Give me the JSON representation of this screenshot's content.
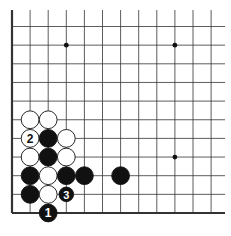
{
  "diagram": {
    "type": "go-board-corner",
    "corner": "bottom-left",
    "colors": {
      "background": "#ffffff",
      "line": "#333333",
      "black_stone": "#111111",
      "white_stone": "#ffffff"
    },
    "star_points": [
      {
        "col": 3,
        "row": 1
      },
      {
        "col": 9,
        "row": 1
      },
      {
        "col": 9,
        "row": 7
      }
    ],
    "stones": [
      {
        "color": "white",
        "col": 1,
        "row": 5
      },
      {
        "color": "white",
        "col": 2,
        "row": 5
      },
      {
        "color": "white",
        "col": 1,
        "row": 6,
        "label": "2"
      },
      {
        "color": "black",
        "col": 2,
        "row": 6
      },
      {
        "color": "white",
        "col": 3,
        "row": 6
      },
      {
        "color": "white",
        "col": 1,
        "row": 7
      },
      {
        "color": "black",
        "col": 2,
        "row": 7
      },
      {
        "color": "white",
        "col": 3,
        "row": 7
      },
      {
        "color": "black",
        "col": 1,
        "row": 8
      },
      {
        "color": "white",
        "col": 2,
        "row": 8
      },
      {
        "color": "black",
        "col": 3,
        "row": 8
      },
      {
        "color": "black",
        "col": 4,
        "row": 8
      },
      {
        "color": "black",
        "col": 6,
        "row": 8
      },
      {
        "color": "black",
        "col": 1,
        "row": 9
      },
      {
        "color": "white",
        "col": 2,
        "row": 9
      },
      {
        "color": "black",
        "col": 3,
        "row": 9,
        "label": "3",
        "small": true
      },
      {
        "color": "black",
        "col": 2,
        "row": 10,
        "label": "1"
      }
    ]
  }
}
